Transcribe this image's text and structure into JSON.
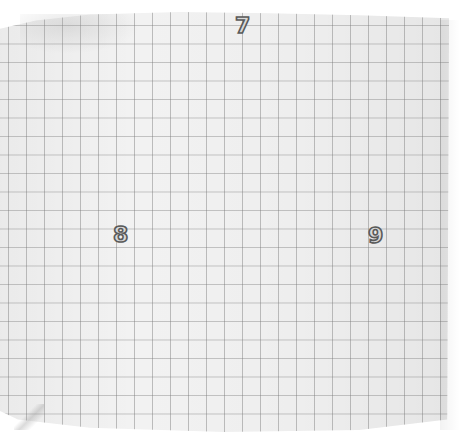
{
  "scene": {
    "description": "Photograph of a sheet of grey-lined graph paper with three outlined numerals",
    "background_color": "#ffffff",
    "paper_color": "#f2f2f2",
    "grid_line_color": "#9a9a9a",
    "grid_spacing_px": 18
  },
  "labels": [
    {
      "text": "7",
      "position": "top-center"
    },
    {
      "text": "8",
      "position": "middle-left"
    },
    {
      "text": "9",
      "position": "middle-right"
    }
  ]
}
